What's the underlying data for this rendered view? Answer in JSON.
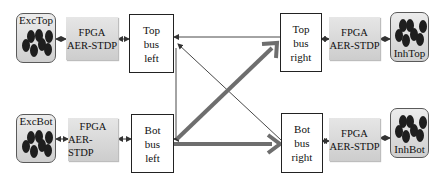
{
  "diagram": {
    "populations": {
      "exc_top": {
        "label": "ExcTop"
      },
      "exc_bot": {
        "label": "ExcBot"
      },
      "inh_top": {
        "label": "InhTop"
      },
      "inh_bot": {
        "label": "InhBot"
      }
    },
    "fpga_blocks": {
      "top_left": {
        "line1": "FPGA",
        "line2": "AER-STDP"
      },
      "bot_left": {
        "line1": "FPGA",
        "line2": "AER-STDP"
      },
      "top_right": {
        "line1": "FPGA",
        "line2": "AER-STDP"
      },
      "bot_right": {
        "line1": "FPGA",
        "line2": "AER-STDP"
      }
    },
    "buses": {
      "top_left": {
        "line1": "Top",
        "line2": "bus",
        "line3": "left"
      },
      "bot_left": {
        "line1": "Bot",
        "line2": "bus",
        "line3": "left"
      },
      "top_right": {
        "line1": "Top",
        "line2": "bus",
        "line3": "right"
      },
      "bot_right": {
        "line1": "Bot",
        "line2": "bus",
        "line3": "right"
      }
    },
    "connections": [
      {
        "from": "ExcTop",
        "to": "FPGA top-left",
        "style": "bidirectional-thin"
      },
      {
        "from": "FPGA top-left",
        "to": "Top bus left",
        "style": "bidirectional-thin"
      },
      {
        "from": "ExcBot",
        "to": "FPGA bot-left",
        "style": "bidirectional-thin"
      },
      {
        "from": "FPGA bot-left",
        "to": "Bot bus left",
        "style": "bidirectional-thin"
      },
      {
        "from": "Top bus right",
        "to": "FPGA top-right",
        "style": "bidirectional-thin"
      },
      {
        "from": "FPGA top-right",
        "to": "InhTop",
        "style": "bidirectional-thin"
      },
      {
        "from": "Bot bus right",
        "to": "FPGA bot-right",
        "style": "bidirectional-thin"
      },
      {
        "from": "FPGA bot-right",
        "to": "InhBot",
        "style": "bidirectional-thin"
      },
      {
        "from": "Top bus right",
        "to": "Top bus left",
        "style": "thin"
      },
      {
        "from": "Bot bus right",
        "to": "Top bus left",
        "style": "thin"
      },
      {
        "from": "Top bus right",
        "to": "Bot bus left",
        "style": "thin-vertical-route"
      },
      {
        "from": "Bot bus left",
        "to": "Top bus right",
        "style": "thick"
      },
      {
        "from": "Bot bus left",
        "to": "Bot bus right",
        "style": "thick"
      }
    ],
    "colors": {
      "thick_arrow": "#6e6e6e",
      "thin_arrow": "#333333",
      "population_fill": "#d9d9d9",
      "fpga_fill": "#dcdcdc"
    }
  }
}
